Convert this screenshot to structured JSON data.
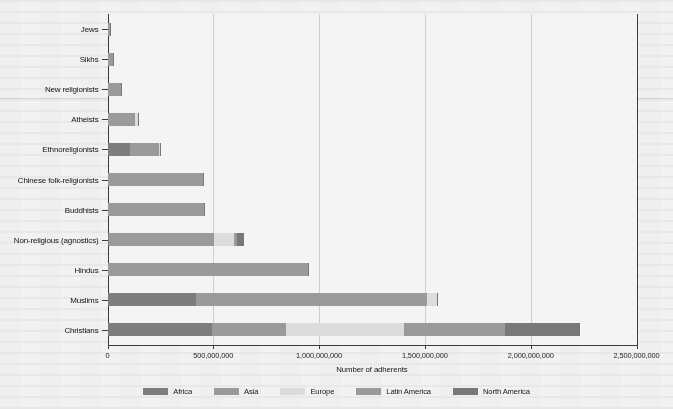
{
  "chart_data": {
    "type": "bar",
    "orientation": "horizontal",
    "stacked": true,
    "title": "",
    "xlabel": "Number of adherents",
    "ylabel": "",
    "xlim": [
      0,
      2500000000
    ],
    "xticks": [
      0,
      500000000,
      1000000000,
      1500000000,
      2000000000,
      2500000000
    ],
    "xtick_labels": [
      "0",
      "500,000,000",
      "1,000,000,000",
      "1,500,000,000",
      "2,000,000,000",
      "2,500,000,000"
    ],
    "grid": "vertical",
    "legend_position": "bottom",
    "categories": [
      "Jews",
      "Sikhs",
      "New religionists",
      "Atheists",
      "Ethnoreligionists",
      "Chinese folk-religionists",
      "Buddhists",
      "Non-religious (agnostics)",
      "Hindus",
      "Muslims",
      "Christians"
    ],
    "series": [
      {
        "name": "Africa",
        "color": "#7d7d7d",
        "values": [
          1000000,
          1000000,
          2000000,
          1000000,
          105000000,
          1000000,
          1000000,
          6000000,
          3000000,
          420000000,
          495000000
        ]
      },
      {
        "name": "Asia",
        "color": "#9a9a9a",
        "values": [
          6000000,
          26000000,
          62000000,
          130000000,
          140000000,
          450000000,
          450000000,
          495000000,
          940000000,
          1090000000,
          350000000
        ]
      },
      {
        "name": "Europe",
        "color": "#dcdcdc",
        "values": [
          2000000,
          1000000,
          1000000,
          12000000,
          1000000,
          1000000,
          2000000,
          95000000,
          2000000,
          45000000,
          555000000
        ]
      },
      {
        "name": "Latin America",
        "color": "#9a9a9a",
        "values": [
          1000000,
          0,
          1000000,
          1000000,
          3000000,
          1000000,
          1000000,
          18000000,
          1000000,
          2000000,
          480000000
        ]
      },
      {
        "name": "North America",
        "color": "#787878",
        "values": [
          6000000,
          1000000,
          2000000,
          2000000,
          1000000,
          1000000,
          4000000,
          32000000,
          2000000,
          5000000,
          355000000
        ]
      }
    ],
    "legend": [
      "Africa",
      "Asia",
      "Europe",
      "Latin America",
      "North America"
    ]
  },
  "colors": {
    "africa": "#7d7d7d",
    "asia": "#9a9a9a",
    "europe": "#dcdcdc",
    "latin_america": "#9a9a9a",
    "north_america": "#787878",
    "axis": "#3a3a3a",
    "grid": "#cfcfcf",
    "page": "#f2f2f2"
  }
}
